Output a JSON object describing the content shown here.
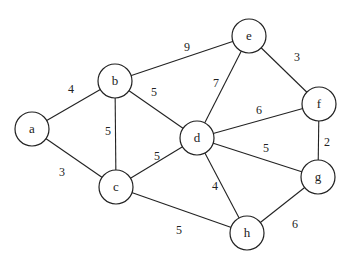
{
  "graph": {
    "type": "undirected-weighted",
    "node_radius": 17,
    "nodes": [
      {
        "id": "a",
        "label": "a",
        "x": 32,
        "y": 129
      },
      {
        "id": "b",
        "label": "b",
        "x": 115,
        "y": 81
      },
      {
        "id": "c",
        "label": "c",
        "x": 116,
        "y": 187
      },
      {
        "id": "d",
        "label": "d",
        "x": 197,
        "y": 138
      },
      {
        "id": "e",
        "label": "e",
        "x": 249,
        "y": 36
      },
      {
        "id": "f",
        "label": "f",
        "x": 319,
        "y": 104
      },
      {
        "id": "g",
        "label": "g",
        "x": 318,
        "y": 177
      },
      {
        "id": "h",
        "label": "h",
        "x": 247,
        "y": 233
      }
    ],
    "edges": [
      {
        "from": "a",
        "to": "b",
        "weight": "4",
        "lx": 71,
        "ly": 89
      },
      {
        "from": "a",
        "to": "c",
        "weight": "3",
        "lx": 62,
        "ly": 172
      },
      {
        "from": "b",
        "to": "c",
        "weight": "5",
        "lx": 108,
        "ly": 131
      },
      {
        "from": "b",
        "to": "d",
        "weight": "5",
        "lx": 154,
        "ly": 92
      },
      {
        "from": "b",
        "to": "e",
        "weight": "9",
        "lx": 187,
        "ly": 47
      },
      {
        "from": "c",
        "to": "d",
        "weight": "5",
        "lx": 157,
        "ly": 156
      },
      {
        "from": "c",
        "to": "h",
        "weight": "5",
        "lx": 179,
        "ly": 230
      },
      {
        "from": "d",
        "to": "e",
        "weight": "7",
        "lx": 216,
        "ly": 83
      },
      {
        "from": "d",
        "to": "f",
        "weight": "6",
        "lx": 259,
        "ly": 110
      },
      {
        "from": "d",
        "to": "g",
        "weight": "5",
        "lx": 266,
        "ly": 148
      },
      {
        "from": "d",
        "to": "h",
        "weight": "4",
        "lx": 215,
        "ly": 186
      },
      {
        "from": "e",
        "to": "f",
        "weight": "3",
        "lx": 297,
        "ly": 57
      },
      {
        "from": "f",
        "to": "g",
        "weight": "2",
        "lx": 327,
        "ly": 142
      },
      {
        "from": "g",
        "to": "h",
        "weight": "6",
        "lx": 295,
        "ly": 224
      }
    ]
  }
}
